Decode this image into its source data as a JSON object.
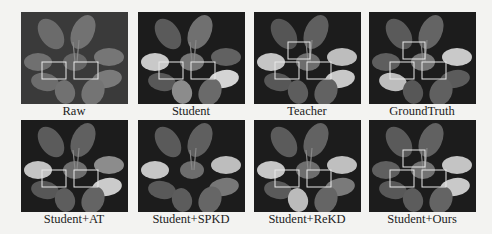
{
  "figure": {
    "panels": [
      {
        "label": "Raw",
        "style": "raw",
        "boxes": 2
      },
      {
        "label": "Student",
        "style": "student",
        "boxes": 2
      },
      {
        "label": "Teacher",
        "style": "teacher",
        "boxes": 3
      },
      {
        "label": "GroundTruth",
        "style": "gt",
        "boxes": 3
      },
      {
        "label": "Student+AT",
        "style": "at",
        "boxes": 2
      },
      {
        "label": "Student+SPKD",
        "style": "spkd",
        "boxes": 0
      },
      {
        "label": "Student+ReKD",
        "style": "rekd",
        "boxes": 2
      },
      {
        "label": "Student+Ours",
        "style": "ours",
        "boxes": 3
      }
    ],
    "colors": {
      "background": "#1c1c1c",
      "highlight_box": "#e8e8e8",
      "page": "#f3f3f1"
    }
  }
}
